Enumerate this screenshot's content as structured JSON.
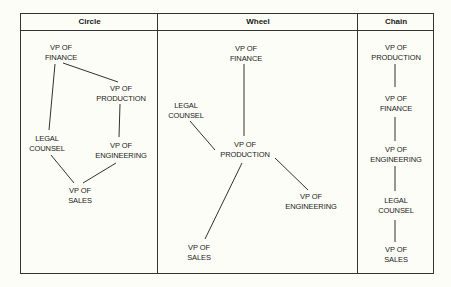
{
  "columns": [
    {
      "id": "circle",
      "title": "Circle"
    },
    {
      "id": "wheel",
      "title": "Wheel"
    },
    {
      "id": "chain",
      "title": "Chain"
    }
  ],
  "circle": {
    "nodes": {
      "finance": {
        "line1": "VP OF",
        "line2": "FINANCE"
      },
      "production": {
        "line1": "VP OF",
        "line2": "PRODUCTION"
      },
      "legal": {
        "line1": "LEGAL",
        "line2": "COUNSEL"
      },
      "engineering": {
        "line1": "VP OF",
        "line2": "ENGINEERING"
      },
      "sales": {
        "line1": "VP OF",
        "line2": "SALES"
      }
    },
    "edges": [
      [
        "finance",
        "production"
      ],
      [
        "production",
        "engineering"
      ],
      [
        "engineering",
        "sales"
      ],
      [
        "sales",
        "legal"
      ],
      [
        "legal",
        "finance"
      ]
    ]
  },
  "wheel": {
    "nodes": {
      "finance": {
        "line1": "VP OF",
        "line2": "FINANCE"
      },
      "legal": {
        "line1": "LEGAL",
        "line2": "COUNSEL"
      },
      "production": {
        "line1": "VP OF",
        "line2": "PRODUCTION"
      },
      "engineering": {
        "line1": "VP OF",
        "line2": "ENGINEERING"
      },
      "sales": {
        "line1": "VP OF",
        "line2": "SALES"
      }
    },
    "edges": [
      [
        "production",
        "finance"
      ],
      [
        "production",
        "legal"
      ],
      [
        "production",
        "engineering"
      ],
      [
        "production",
        "sales"
      ]
    ]
  },
  "chain": {
    "nodes": {
      "production": {
        "line1": "VP OF",
        "line2": "PRODUCTION"
      },
      "finance": {
        "line1": "VP OF",
        "line2": "FINANCE"
      },
      "engineering": {
        "line1": "VP OF",
        "line2": "ENGINEERING"
      },
      "legal": {
        "line1": "LEGAL",
        "line2": "COUNSEL"
      },
      "sales": {
        "line1": "VP OF",
        "line2": "SALES"
      }
    },
    "edges": [
      [
        "production",
        "finance"
      ],
      [
        "finance",
        "engineering"
      ],
      [
        "engineering",
        "legal"
      ],
      [
        "legal",
        "sales"
      ]
    ]
  },
  "colors": {
    "ink": "#1a1a1a",
    "paper": "#fdfdf7",
    "rule": "#333333"
  }
}
